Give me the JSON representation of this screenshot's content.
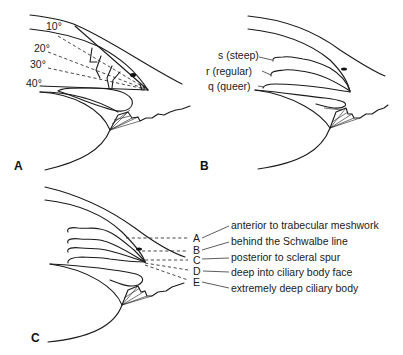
{
  "figure": {
    "panels": [
      {
        "id": "A",
        "label": "A",
        "angle_labels": [
          "10°",
          "20°",
          "30°",
          "40°"
        ]
      },
      {
        "id": "B",
        "label": "B",
        "iris_labels": [
          "s (steep)",
          "r (regular)",
          "q (queer)"
        ]
      },
      {
        "id": "C",
        "label": "C",
        "insertion_levels": [
          {
            "letter": "A",
            "description": "anterior to trabecular meshwork"
          },
          {
            "letter": "B",
            "description": "behind the Schwalbe line"
          },
          {
            "letter": "C",
            "description": "posterior to scleral spur"
          },
          {
            "letter": "D",
            "description": "deep into ciliary body face"
          },
          {
            "letter": "E",
            "description": "extremely deep ciliary body"
          }
        ]
      }
    ]
  }
}
